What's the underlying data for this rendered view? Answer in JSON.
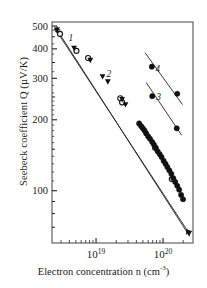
{
  "chart_data": {
    "type": "scatter",
    "title": "",
    "xlabel": "Electron concentration n (cm",
    "xlabel_sup": "-3",
    "xlabel_tail": ")",
    "ylabel": "Seebeck coefficient  Q (µV/K)",
    "xscale": "log",
    "yscale": "log",
    "xlim": [
      2.2e+18,
      2.8e+20
    ],
    "ylim": [
      60,
      520
    ],
    "xticks_major": [
      1e+19,
      1e+20
    ],
    "xticklabels": [
      "10",
      "10"
    ],
    "xtick_exponents": [
      "19",
      "20"
    ],
    "yticks_major": [
      100,
      200,
      300,
      400,
      500
    ],
    "yticklabels": [
      "100",
      "200",
      "300",
      "400",
      "500"
    ],
    "grid": false,
    "legend": null,
    "curve_labels": [
      {
        "text": "1",
        "x": 4.2e+18,
        "y": 432
      },
      {
        "text": "2",
        "x": 1.55e+19,
        "y": 303
      },
      {
        "text": "3",
        "x": 8.6e+19,
        "y": 243
      },
      {
        "text": "4",
        "x": 8.3e+19,
        "y": 320
      }
    ],
    "series": [
      {
        "name": "1",
        "marker": "open-circle",
        "fit_line": {
          "x": [
            2.55e+18,
            2.45e+20
          ],
          "y": [
            478,
            66
          ]
        },
        "points": [
          {
            "x": 2.9e+18,
            "y": 463
          },
          {
            "x": 5.1e+18,
            "y": 392
          },
          {
            "x": 7.6e+18,
            "y": 366
          },
          {
            "x": 2.3e+19,
            "y": 247
          },
          {
            "x": 2.45e+19,
            "y": 237
          },
          {
            "x": 7.6e+19,
            "y": 152
          },
          {
            "x": 1.35e+20,
            "y": 112
          }
        ]
      },
      {
        "name": "2",
        "marker": "filled-triangle-down",
        "fit_line": {
          "x": [
            2.6e+18,
            2.5e+20
          ],
          "y": [
            483,
            64
          ]
        },
        "points": [
          {
            "x": 2.6e+18,
            "y": 481
          },
          {
            "x": 4.7e+18,
            "y": 403
          },
          {
            "x": 8.2e+18,
            "y": 358
          },
          {
            "x": 1.25e+19,
            "y": 305
          },
          {
            "x": 1.5e+19,
            "y": 290
          },
          {
            "x": 2.45e+19,
            "y": 244
          },
          {
            "x": 2.75e+19,
            "y": 232
          },
          {
            "x": 2.45e+20,
            "y": 66
          }
        ]
      },
      {
        "name": "main-dense",
        "marker": "filled-circle",
        "fit_line": null,
        "points": [
          {
            "x": 4.4e+19,
            "y": 193
          },
          {
            "x": 4.7e+19,
            "y": 188
          },
          {
            "x": 5e+19,
            "y": 184
          },
          {
            "x": 5.3e+19,
            "y": 180
          },
          {
            "x": 5.6e+19,
            "y": 175
          },
          {
            "x": 6e+19,
            "y": 170
          },
          {
            "x": 6.4e+19,
            "y": 166
          },
          {
            "x": 6.9e+19,
            "y": 161
          },
          {
            "x": 7.3e+19,
            "y": 157
          },
          {
            "x": 7.8e+19,
            "y": 152
          },
          {
            "x": 8.3e+19,
            "y": 147
          },
          {
            "x": 8.9e+19,
            "y": 143
          },
          {
            "x": 9.5e+19,
            "y": 139
          },
          {
            "x": 1.02e+20,
            "y": 134
          },
          {
            "x": 1.09e+20,
            "y": 130
          },
          {
            "x": 1.16e+20,
            "y": 126
          },
          {
            "x": 1.24e+20,
            "y": 122
          },
          {
            "x": 1.33e+20,
            "y": 118
          },
          {
            "x": 1.42e+20,
            "y": 113
          },
          {
            "x": 1.52e+20,
            "y": 109
          },
          {
            "x": 1.63e+20,
            "y": 105
          },
          {
            "x": 1.74e+20,
            "y": 101
          },
          {
            "x": 1.86e+20,
            "y": 96
          },
          {
            "x": 1.99e+20,
            "y": 92
          }
        ]
      },
      {
        "name": "3",
        "marker": "filled-circle",
        "fit_line": {
          "x": [
            5.6e+19,
            1.9e+20
          ],
          "y": [
            288,
            172
          ]
        },
        "points": [
          {
            "x": 6.9e+19,
            "y": 252
          },
          {
            "x": 1.6e+20,
            "y": 184
          }
        ]
      },
      {
        "name": "4",
        "marker": "filled-circle",
        "fit_line": {
          "x": [
            5.4e+19,
            1.95e+20
          ],
          "y": [
            385,
            232
          ]
        },
        "points": [
          {
            "x": 6.8e+19,
            "y": 336
          },
          {
            "x": 1.63e+20,
            "y": 258
          }
        ]
      }
    ],
    "special_markers": [
      {
        "type": "star-cross",
        "x": 2.62e+18,
        "y": 482
      },
      {
        "type": "filled-triangle-right",
        "x": 2.42e+20,
        "y": 67
      }
    ]
  },
  "axes": {
    "frame_color": "#555555",
    "line_color": "#222222",
    "marker_color": "#111111",
    "text_color": "#1a1a1a",
    "background": "#ffffff"
  }
}
